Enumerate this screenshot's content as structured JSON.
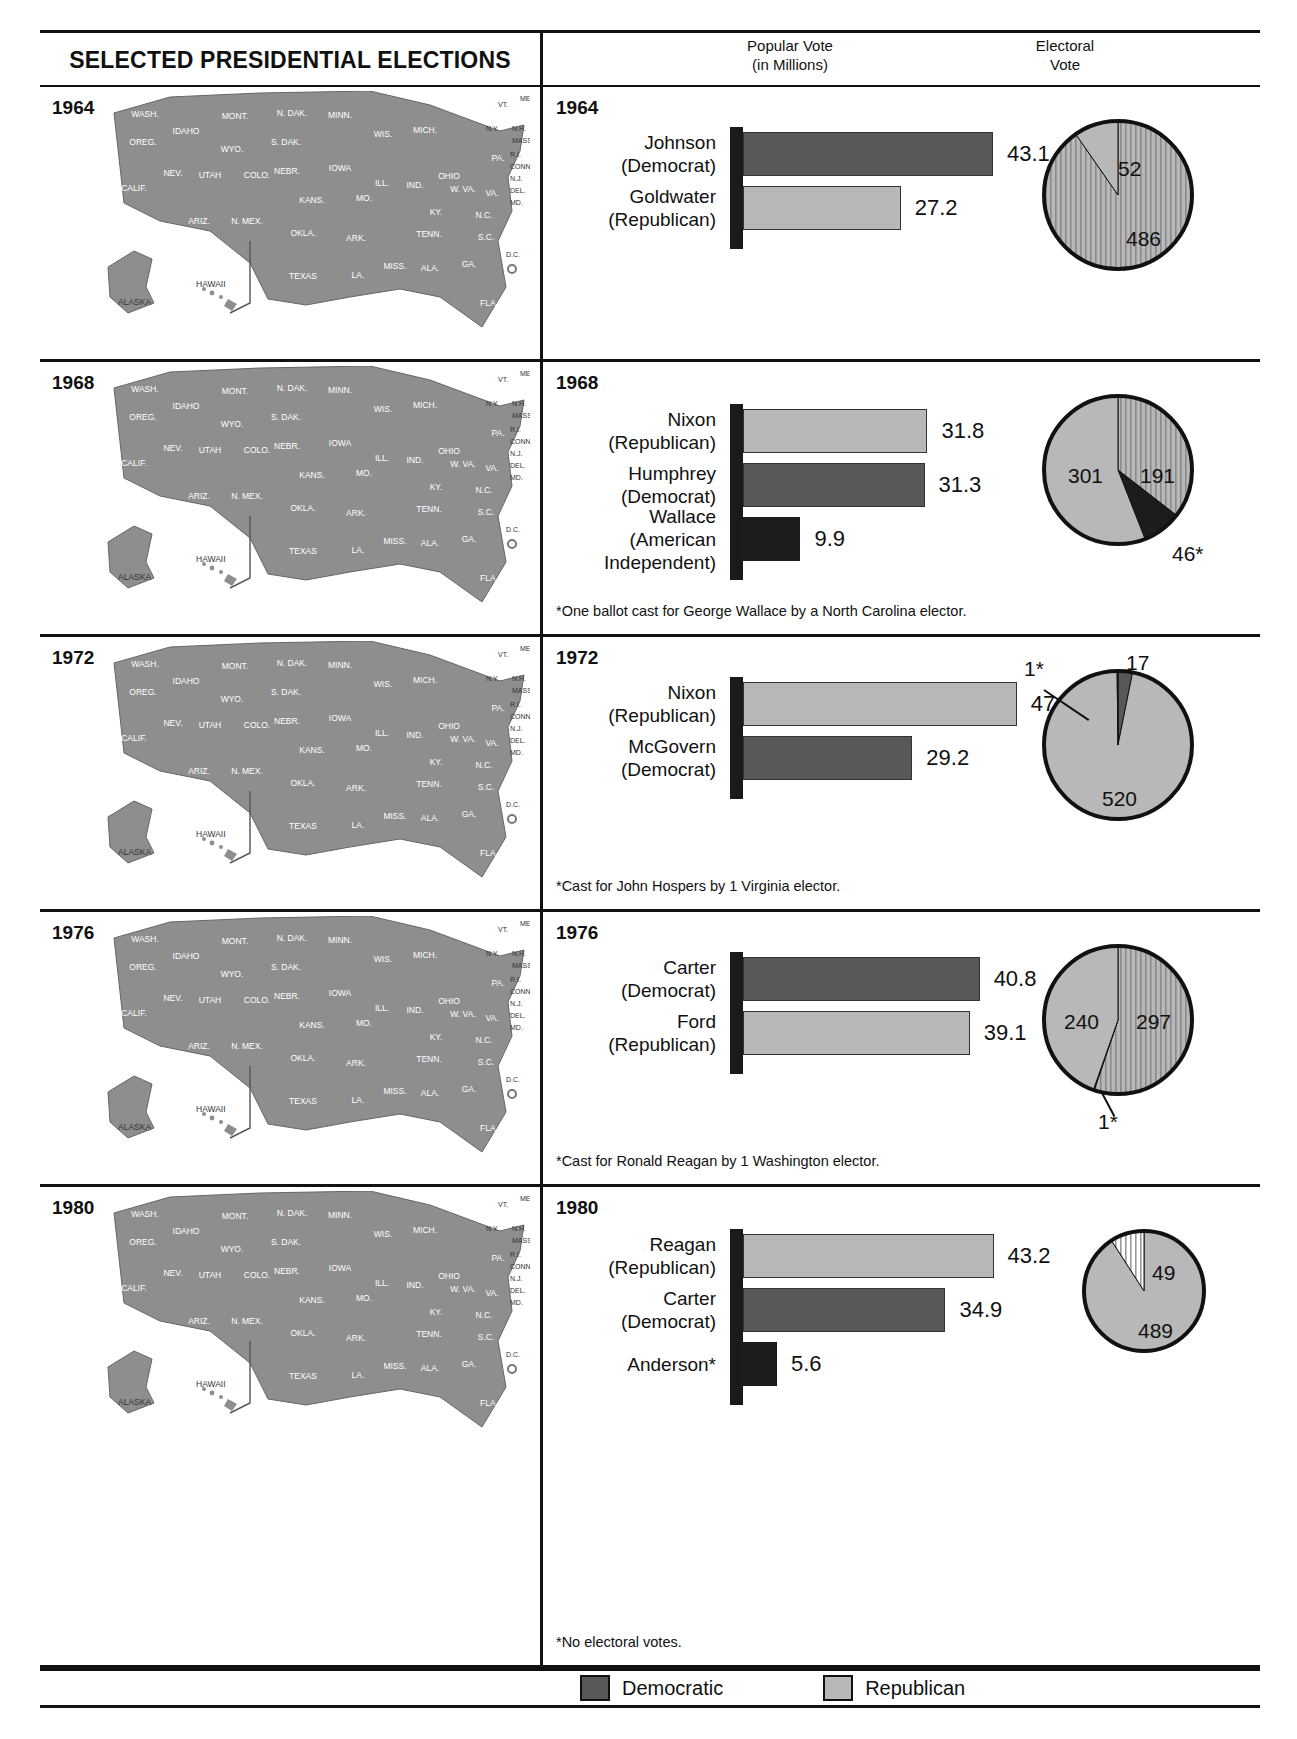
{
  "header": {
    "title": "SELECTED PRESIDENTIAL ELECTIONS",
    "popular_vote_line1": "Popular Vote",
    "popular_vote_line2": "(in Millions)",
    "electoral_line1": "Electoral",
    "electoral_line2": "Vote"
  },
  "legend": {
    "democratic": "Democratic",
    "republican": "Republican"
  },
  "chart_data": {
    "type": "bar",
    "title": "SELECTED PRESIDENTIAL ELECTIONS",
    "xlabel": "Popular Vote (in Millions)",
    "ylabel": "",
    "sections": [
      {
        "year": "1964",
        "year_left": "1964",
        "candidates": [
          {
            "name": "Johnson",
            "party": "(Democrat)",
            "popular": "43.1",
            "party_key": "dem"
          },
          {
            "name": "Goldwater",
            "party": "(Republican)",
            "popular": "27.2",
            "party_key": "rep"
          }
        ],
        "electoral": [
          {
            "label": "486",
            "value": 486,
            "party_key": "dem"
          },
          {
            "label": "52",
            "value": 52,
            "party_key": "rep"
          }
        ],
        "footnote": ""
      },
      {
        "year": "1968",
        "year_left": "1968",
        "candidates": [
          {
            "name": "Nixon",
            "party": "(Republican)",
            "popular": "31.8",
            "party_key": "rep"
          },
          {
            "name": "Humphrey",
            "party": "(Democrat)",
            "popular": "31.3",
            "party_key": "dem"
          },
          {
            "name": "Wallace",
            "party": "(American\nIndependent)",
            "popular": "9.9",
            "party_key": "ind"
          }
        ],
        "electoral": [
          {
            "label": "301",
            "value": 301,
            "party_key": "rep"
          },
          {
            "label": "191",
            "value": 191,
            "party_key": "dem"
          },
          {
            "label": "46*",
            "value": 46,
            "party_key": "ind"
          }
        ],
        "footnote": "*One ballot cast for George Wallace by a North Carolina elector."
      },
      {
        "year": "1972",
        "year_left": "1972",
        "candidates": [
          {
            "name": "Nixon",
            "party": "(Republican)",
            "popular": "47.2",
            "party_key": "rep"
          },
          {
            "name": "McGovern",
            "party": "(Democrat)",
            "popular": "29.2",
            "party_key": "dem"
          }
        ],
        "electoral": [
          {
            "label": "520",
            "value": 520,
            "party_key": "rep"
          },
          {
            "label": "17",
            "value": 17,
            "party_key": "dem"
          },
          {
            "label": "1*",
            "value": 1,
            "party_key": "ind"
          }
        ],
        "footnote": "*Cast for John Hospers by 1 Virginia elector."
      },
      {
        "year": "1976",
        "year_left": "1976",
        "candidates": [
          {
            "name": "Carter",
            "party": "(Democrat)",
            "popular": "40.8",
            "party_key": "dem"
          },
          {
            "name": "Ford",
            "party": "(Republican)",
            "popular": "39.1",
            "party_key": "rep"
          }
        ],
        "electoral": [
          {
            "label": "297",
            "value": 297,
            "party_key": "dem"
          },
          {
            "label": "240",
            "value": 240,
            "party_key": "rep"
          },
          {
            "label": "1*",
            "value": 1,
            "party_key": "ind"
          }
        ],
        "footnote": "*Cast for Ronald Reagan by 1 Washington elector."
      },
      {
        "year": "1980",
        "year_left": "1980",
        "candidates": [
          {
            "name": "Reagan",
            "party": "(Republican)",
            "popular": "43.2",
            "party_key": "rep"
          },
          {
            "name": "Carter",
            "party": "(Democrat)",
            "popular": "34.9",
            "party_key": "dem"
          },
          {
            "name": "Anderson*",
            "party": "",
            "popular": "5.6",
            "party_key": "ind"
          }
        ],
        "electoral": [
          {
            "label": "489",
            "value": 489,
            "party_key": "rep"
          },
          {
            "label": "49",
            "value": 49,
            "party_key": "dem"
          }
        ],
        "footnote": "*No electoral votes."
      }
    ]
  },
  "map_labels": {
    "wash": "WASH.",
    "oreg": "OREG.",
    "calif": "CALIF.",
    "nev": "NEV.",
    "idaho": "IDAHO",
    "mont": "MONT.",
    "wyo": "WYO.",
    "utah": "UTAH",
    "ariz": "ARIZ.",
    "colo": "COLO.",
    "nmex": "N. MEX.",
    "ndak": "N. DAK.",
    "sdak": "S. DAK.",
    "nebr": "NEBR.",
    "kans": "KANS.",
    "okla": "OKLA.",
    "texas": "TEXAS",
    "minn": "MINN.",
    "iowa": "IOWA",
    "mo": "MO.",
    "ark": "ARK.",
    "la": "LA.",
    "wis": "WIS.",
    "ill": "ILL.",
    "ind": "IND.",
    "mich": "MICH.",
    "ohio": "OHIO",
    "ky": "KY.",
    "tenn": "TENN.",
    "miss": "MISS.",
    "ala": "ALA.",
    "ga": "GA.",
    "fla": "FLA.",
    "sc": "S.C.",
    "nc": "N.C.",
    "va": "VA.",
    "wva": "W. VA.",
    "pa": "PA.",
    "ny": "N.Y.",
    "vt": "VT.",
    "me": "ME.",
    "nh": "N.H.",
    "mass": "MASS.",
    "ri": "R.I.",
    "conn": "CONN.",
    "nj": "N.J.",
    "del": "DEL.",
    "md": "MD.",
    "dc": "D.C.",
    "alaska": "ALASKA",
    "hawaii": "HAWAII"
  }
}
